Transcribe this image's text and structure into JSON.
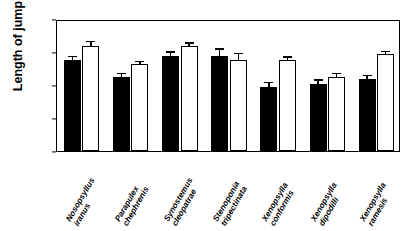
{
  "chart_data": {
    "type": "bar",
    "title": "",
    "xlabel": "",
    "ylabel": "Length of jump (mm)",
    "ylim": [
      0,
      160
    ],
    "yticks": [
      0,
      40,
      80,
      120,
      160
    ],
    "grid": false,
    "legend": "none",
    "orientation": "vertical",
    "categories": [
      "Nosopsyllus iranus",
      "Parapulex chephrenis",
      "Synostemus cleopatrae",
      "Stenoponia tripectinata",
      "Xenopsylla conformis",
      "Xenopsylla dipodilli",
      "Xenopsylla ramesis"
    ],
    "category_lines": [
      [
        "Nosopsyllus",
        "iranus"
      ],
      [
        "Parapulex",
        "chephrenis"
      ],
      [
        "Synostemus",
        "cleopatrae"
      ],
      [
        "Stenoponia",
        "tripectinata"
      ],
      [
        "Xenopsylla",
        "conformis"
      ],
      [
        "Xenopsylla",
        "dipodilli"
      ],
      [
        "Xenopsylla",
        "ramesis"
      ]
    ],
    "series": [
      {
        "name": "black",
        "color": "#000000",
        "values": [
          110,
          90,
          115,
          115,
          78,
          81,
          87
        ],
        "errors": [
          4,
          3,
          4,
          8,
          4,
          4,
          4
        ]
      },
      {
        "name": "white",
        "color": "#ffffff",
        "values": [
          127,
          105,
          127,
          110,
          110,
          90,
          117
        ],
        "errors": [
          5,
          3,
          3,
          7,
          3,
          3,
          3
        ]
      }
    ]
  },
  "axis": {
    "y_title": "Length of jump (mm)",
    "y_tick_labels": [
      "0",
      "40",
      "80",
      "120",
      "160"
    ]
  }
}
